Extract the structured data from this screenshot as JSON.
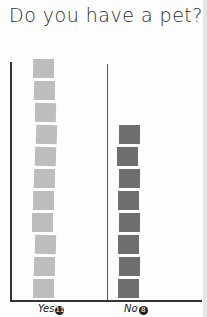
{
  "title": "Do you have a pet?",
  "colors": {
    "yes": "#bdbdbd",
    "no": "#6e6e6e",
    "axis": "#333333"
  },
  "labels": {
    "yes": {
      "text": "Yes",
      "count": "11"
    },
    "no": {
      "text": "No",
      "count": "8"
    }
  },
  "chart_data": {
    "type": "bar",
    "title": "Do you have a pet?",
    "categories": [
      "Yes",
      "No"
    ],
    "values": [
      11,
      8
    ],
    "xlabel": "",
    "ylabel": "",
    "ylim": [
      0,
      11
    ],
    "grid": false,
    "legend": null,
    "style": "pictograph — one square per response",
    "annotations": [
      "Yes (11)",
      "No (8)"
    ]
  }
}
